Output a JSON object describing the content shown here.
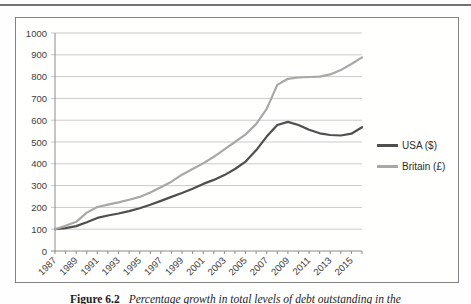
{
  "figure": {
    "label": "Figure 6.2",
    "caption": "Percentage growth in total levels of debt outstanding in the"
  },
  "chart_data": {
    "type": "line",
    "title": "",
    "xlabel": "",
    "ylabel": "",
    "x": [
      1987,
      1988,
      1989,
      1990,
      1991,
      1992,
      1993,
      1994,
      1995,
      1996,
      1997,
      1998,
      1999,
      2000,
      2001,
      2002,
      2003,
      2004,
      2005,
      2006,
      2007,
      2008,
      2009,
      2010,
      2011,
      2012,
      2013,
      2014,
      2015,
      2016
    ],
    "series": [
      {
        "name": "USA ($)",
        "color": "#4f4f4f",
        "values": [
          100,
          105,
          114,
          132,
          152,
          163,
          172,
          183,
          196,
          212,
          230,
          248,
          266,
          286,
          308,
          326,
          348,
          376,
          410,
          462,
          525,
          578,
          592,
          578,
          556,
          540,
          532,
          530,
          538,
          568
        ]
      },
      {
        "name": "Britain (£)",
        "color": "#a8a8a8",
        "values": [
          100,
          116,
          134,
          176,
          202,
          213,
          223,
          235,
          248,
          268,
          292,
          318,
          350,
          376,
          402,
          432,
          466,
          500,
          535,
          582,
          652,
          762,
          790,
          796,
          798,
          800,
          810,
          830,
          858,
          888
        ]
      }
    ],
    "ylim": [
      0,
      1000
    ],
    "yticks": [
      0,
      100,
      200,
      300,
      400,
      500,
      600,
      700,
      800,
      900,
      1000
    ],
    "xtick_labels": [
      "1987",
      "1989",
      "1991",
      "1993",
      "1995",
      "1997",
      "1999",
      "2001",
      "2003",
      "2005",
      "2007",
      "2009",
      "2011",
      "2013",
      "2015"
    ],
    "grid": true,
    "legend_position": "right-outside",
    "colors": {
      "grid": "#cacaca",
      "axis": "#8c8c8c",
      "tick_text": "#3d3d3d",
      "frame": "#838383"
    }
  }
}
